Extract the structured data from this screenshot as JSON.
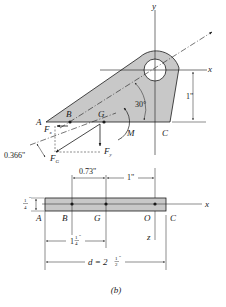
{
  "figure": {
    "caption": "(b)",
    "top_view": {
      "labels": {
        "y_axis": "y",
        "x_axis": "x",
        "A": "A",
        "B": "B",
        "G": "G",
        "C": "C",
        "M": "M",
        "Fx_F": "F",
        "Fx_sub": "x",
        "Fy_F": "F",
        "Fy_sub": "y",
        "FG_F": "F",
        "FG_sub": "G"
      },
      "dimensions": {
        "angle": "30°",
        "height": "1\"",
        "offset": "0.366\""
      }
    },
    "side_view": {
      "labels": {
        "A": "A",
        "B": "B",
        "G": "G",
        "O": "O",
        "C": "C",
        "x_axis": "x",
        "z_axis": "z"
      },
      "dimensions": {
        "thickness_num": "1",
        "thickness_den": "4",
        "thickness_unit": "\"",
        "BG": "0.73\"",
        "GO": "1\"",
        "AG_whole": "1",
        "AG_num": "1",
        "AG_den": "4",
        "AG_unit": "\"",
        "d_prefix": "d = 2",
        "d_num": "1",
        "d_den": "2",
        "d_unit": "\""
      }
    }
  },
  "colors": {
    "plate_fill": "#c8c8c8",
    "line": "#1a1a1a"
  }
}
